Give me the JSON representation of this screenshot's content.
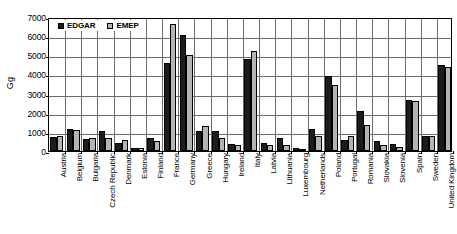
{
  "chart_data": {
    "type": "bar",
    "title": "",
    "xlabel": "",
    "ylabel": "Gg",
    "ylim": [
      0,
      7000
    ],
    "ytick_step": 1000,
    "yticks": [
      7000,
      6000,
      5000,
      4000,
      3000,
      2000,
      1000,
      0
    ],
    "grid": true,
    "legend_position": "top-left",
    "categories": [
      "Austria",
      "Belgium",
      "Bulgaria",
      "Czech Republic",
      "Denmark",
      "Estonia",
      "Finland",
      "France",
      "Germany",
      "Greece",
      "Hungary",
      "Ireland",
      "Italy",
      "Latvia",
      "Lithuania",
      "Luxembourg",
      "Netherlands",
      "Poland",
      "Portugal",
      "Romania",
      "Slovakia",
      "Slovenia",
      "Spain",
      "Sweden",
      "United Kingdom"
    ],
    "series": [
      {
        "name": "EDGAR",
        "color": "#1c1c1c",
        "values": [
          720,
          1130,
          640,
          1070,
          420,
          150,
          660,
          4620,
          6050,
          1020,
          1020,
          370,
          4810,
          440,
          680,
          180,
          1140,
          3910,
          600,
          2110,
          540,
          390,
          2650,
          800,
          4490
        ]
      },
      {
        "name": "EMEP",
        "color": "#b4b4b4",
        "values": [
          790,
          1080,
          700,
          660,
          580,
          160,
          540,
          6620,
          5030,
          1300,
          680,
          310,
          5230,
          320,
          320,
          90,
          800,
          3460,
          800,
          1370,
          340,
          190,
          2630,
          800,
          4370
        ]
      }
    ]
  },
  "legend": {
    "entries": [
      {
        "label": "EDGAR",
        "swatch": "black-square-swatch"
      },
      {
        "label": "EMEP",
        "swatch": "gray-square-swatch"
      }
    ]
  },
  "axes": {
    "y_title": "Gg"
  }
}
